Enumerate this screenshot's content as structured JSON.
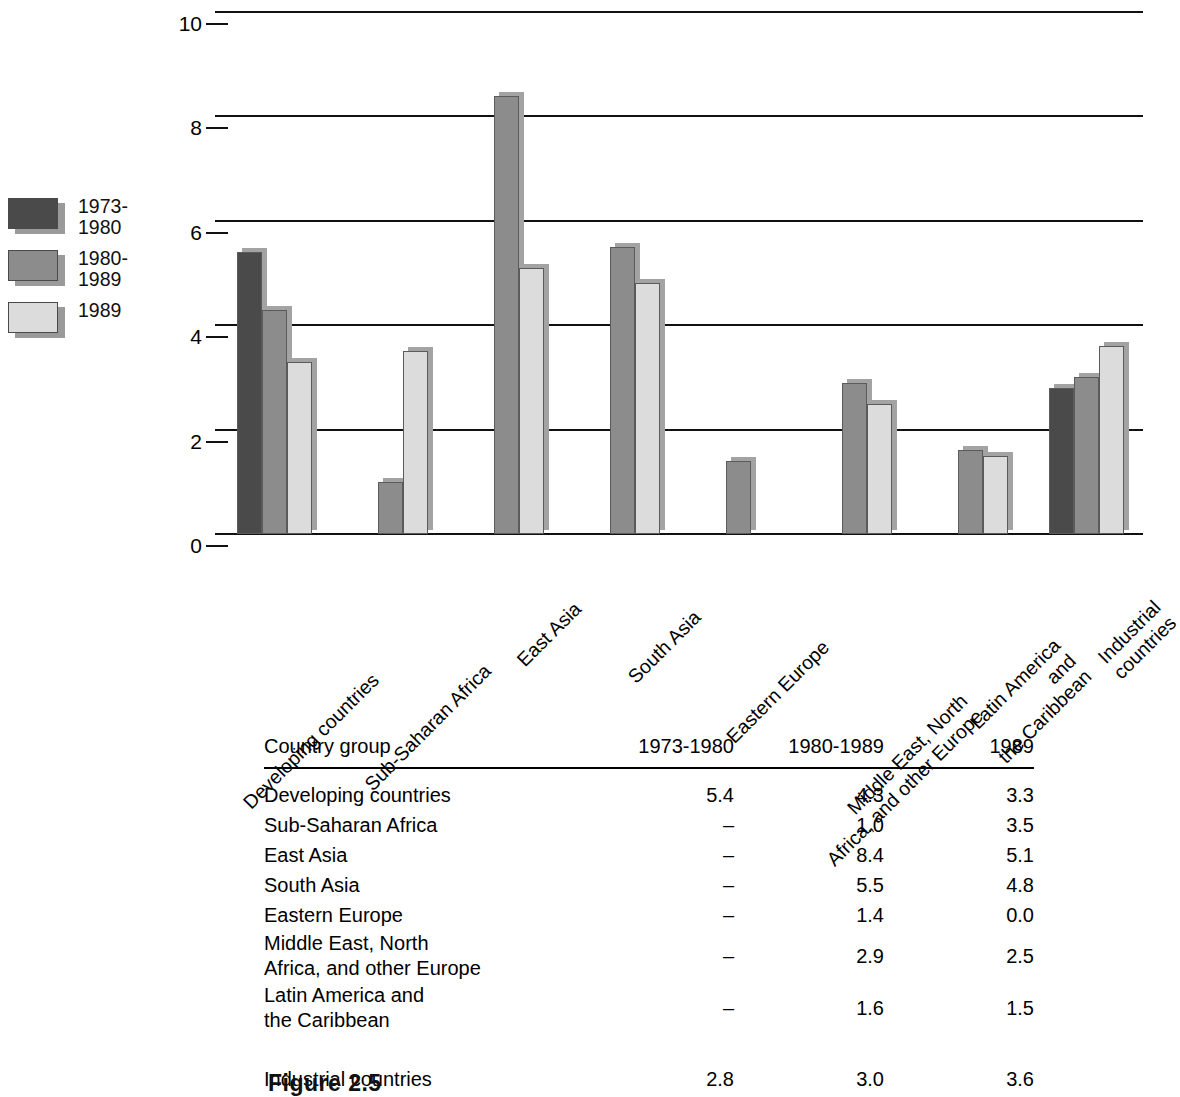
{
  "chart_data": {
    "type": "bar",
    "title": "",
    "subtitle": "",
    "xlabel": "",
    "ylabel": "",
    "ylim": [
      0,
      10
    ],
    "yticks": [
      0,
      2,
      4,
      6,
      8,
      10
    ],
    "grid": true,
    "legend_position": "left",
    "categories": [
      "Developing countries",
      "Sub-Saharan Africa",
      "East Asia",
      "South Asia",
      "Eastern Europe",
      "Middle East, North\nAfrica, and other Europe",
      "Latin America and\nthe Caribbean",
      "Industrial countries"
    ],
    "series": [
      {
        "name": "1973-\n1980",
        "color": "#4a4a4a",
        "values": [
          5.4,
          null,
          null,
          null,
          null,
          null,
          null,
          2.8
        ]
      },
      {
        "name": "1980-\n1989",
        "color": "#8c8c8c",
        "values": [
          4.3,
          1.0,
          8.4,
          5.5,
          1.4,
          2.9,
          1.6,
          3.0
        ]
      },
      {
        "name": "1989",
        "color": "#dcdcdc",
        "values": [
          3.3,
          3.5,
          5.1,
          4.8,
          0.0,
          2.5,
          1.5,
          3.6
        ]
      }
    ]
  },
  "legend": {
    "items": [
      {
        "label": "1973-\n1980",
        "color": "#4a4a4a"
      },
      {
        "label": "1980-\n1989",
        "color": "#8c8c8c"
      },
      {
        "label": "1989",
        "color": "#dcdcdc"
      }
    ]
  },
  "axis": {
    "y_ticks": [
      "10",
      "8",
      "6",
      "4",
      "2",
      "0"
    ]
  },
  "table": {
    "headers": [
      "Country group",
      "1973-1980",
      "1980-1989",
      "1989"
    ],
    "rows": [
      {
        "label": "Developing countries",
        "indent": 0,
        "values": [
          "5.4",
          "4.3",
          "3.3"
        ]
      },
      {
        "label": "Sub-Saharan Africa",
        "indent": 1,
        "values": [
          "–",
          "1.0",
          "3.5"
        ]
      },
      {
        "label": "East Asia",
        "indent": 1,
        "values": [
          "–",
          "8.4",
          "5.1"
        ]
      },
      {
        "label": "South Asia",
        "indent": 1,
        "values": [
          "–",
          "5.5",
          "4.8"
        ]
      },
      {
        "label": "Eastern Europe",
        "indent": 1,
        "values": [
          "–",
          "1.4",
          "0.0"
        ]
      },
      {
        "label": "Middle East, North\n  Africa, and other Europe",
        "indent": 0,
        "values": [
          "–",
          "2.9",
          "2.5"
        ]
      },
      {
        "label": "Latin America and\n  the Caribbean",
        "indent": 0,
        "values": [
          "–",
          "1.6",
          "1.5"
        ]
      },
      {
        "label": "Industrial countries",
        "indent": 0,
        "values": [
          "2.8",
          "3.0",
          "3.6"
        ]
      }
    ]
  },
  "caption": {
    "text": "Figure 2.5"
  },
  "colors": {
    "series_1973_1980": "#4a4a4a",
    "series_1980_1989": "#8c8c8c",
    "series_1989": "#dcdcdc",
    "gridline": "#111111",
    "shadow": "#a3a3a3"
  }
}
